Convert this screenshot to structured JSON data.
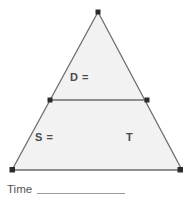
{
  "page": {
    "width": 192,
    "height": 204,
    "background_color": "#ffffff"
  },
  "diagram": {
    "name": "speed-distance-time-formula-triangle",
    "fill_color": "#f2f2f2",
    "stroke_color": "#6e6e6e",
    "vertex_marker_color": "#2b2b2b",
    "apex": {
      "x": 98,
      "y": 12
    },
    "bottom_left": {
      "x": 12,
      "y": 170
    },
    "bottom_right": {
      "x": 182,
      "y": 170
    },
    "divider": {
      "left": {
        "x": 50,
        "y": 100
      },
      "right": {
        "x": 147,
        "y": 100
      }
    },
    "labels": {
      "top": "D =",
      "bottom_left": "S =",
      "bottom_right": "T"
    }
  },
  "footer": {
    "time_label": "Time",
    "time_blank_value": "",
    "blank_line_color": "#9a9a9a"
  }
}
